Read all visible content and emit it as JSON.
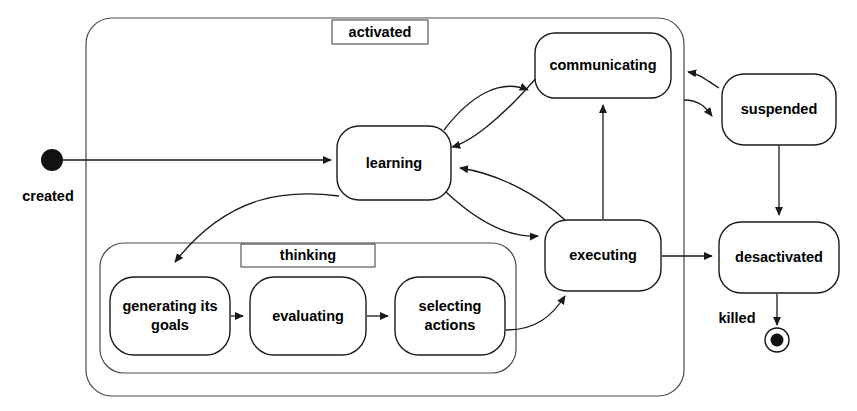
{
  "diagram": {
    "kind": "uml-state-machine",
    "background_color": "#ffffff",
    "line_color": "#1a1a1a",
    "composite_line_color": "#4a4a4a",
    "text_color": "#000000"
  },
  "composites": {
    "activated": {
      "label": "activated",
      "x": 86,
      "y": 18,
      "width": 598,
      "height": 378
    },
    "thinking": {
      "label": "thinking",
      "x": 100,
      "y": 243,
      "width": 416,
      "height": 130
    }
  },
  "states": {
    "learning": {
      "label": "learning",
      "x": 337,
      "y": 126,
      "width": 114,
      "height": 74
    },
    "communicating": {
      "label": "communicating",
      "x": 535,
      "y": 33,
      "width": 136,
      "height": 65
    },
    "executing": {
      "label": "executing",
      "x": 545,
      "y": 220,
      "width": 116,
      "height": 71
    },
    "suspended": {
      "label": "suspended",
      "x": 722,
      "y": 74,
      "width": 114,
      "height": 71
    },
    "desactivated": {
      "label": "desactivated",
      "x": 719,
      "y": 222,
      "width": 120,
      "height": 71
    },
    "generating_its_goals": {
      "label_line1": "generating its",
      "label_line2": "goals",
      "x": 110,
      "y": 277,
      "width": 120,
      "height": 78
    },
    "evaluating": {
      "label": "evaluating",
      "x": 250,
      "y": 277,
      "width": 116,
      "height": 78
    },
    "selecting_actions": {
      "label_line1": "selecting",
      "label_line2": "actions",
      "x": 395,
      "y": 277,
      "width": 110,
      "height": 78
    }
  },
  "pseudostates": {
    "initial": {
      "label": "created",
      "cx": 52,
      "cy": 160,
      "r": 11
    },
    "final": {
      "label": "killed",
      "cx": 777,
      "cy": 340,
      "r_outer": 12,
      "r_inner": 6.5
    }
  },
  "transitions": [
    {
      "id": "created-to-learning",
      "from": "created",
      "to": "learning"
    },
    {
      "id": "learning-to-communicating",
      "from": "learning",
      "to": "communicating"
    },
    {
      "id": "communicating-to-learning",
      "from": "communicating",
      "to": "learning"
    },
    {
      "id": "learning-to-executing",
      "from": "learning",
      "to": "executing"
    },
    {
      "id": "executing-to-learning",
      "from": "executing",
      "to": "learning"
    },
    {
      "id": "executing-to-communicating",
      "from": "executing",
      "to": "communicating"
    },
    {
      "id": "learning-to-generating-its-goals",
      "from": "learning",
      "to": "generating its goals"
    },
    {
      "id": "generating-to-evaluating",
      "from": "generating its goals",
      "to": "evaluating"
    },
    {
      "id": "evaluating-to-selecting",
      "from": "evaluating",
      "to": "selecting actions"
    },
    {
      "id": "selecting-to-executing",
      "from": "selecting actions",
      "to": "executing"
    },
    {
      "id": "activated-to-suspended",
      "from": "activated",
      "to": "suspended"
    },
    {
      "id": "suspended-to-activated",
      "from": "suspended",
      "to": "activated"
    },
    {
      "id": "suspended-to-desactivated",
      "from": "suspended",
      "to": "desactivated"
    },
    {
      "id": "executing-to-desactivated",
      "from": "executing",
      "to": "desactivated"
    },
    {
      "id": "desactivated-to-killed",
      "from": "desactivated",
      "to": "killed"
    }
  ]
}
